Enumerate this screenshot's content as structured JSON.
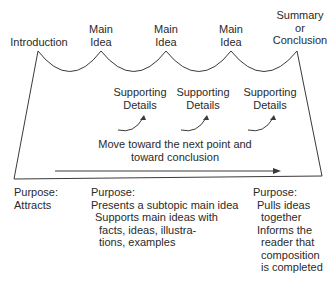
{
  "top_labels": {
    "introduction": "Introduction",
    "main_idea_1": [
      "Main",
      "Idea"
    ],
    "main_idea_2": [
      "Main",
      "Idea"
    ],
    "main_idea_3": [
      "Main",
      "Idea"
    ],
    "conclusion": [
      "Summary",
      "or",
      "Conclusion"
    ]
  },
  "supporting_details": [
    [
      "Supporting",
      "Details"
    ],
    [
      "Supporting",
      "Details"
    ],
    [
      "Supporting",
      "Details"
    ]
  ],
  "move_text": [
    "Move toward the next point and",
    "toward conclusion"
  ],
  "purposes": {
    "introduction": {
      "title": "Purpose:",
      "lines": [
        "Attracts"
      ]
    },
    "body": {
      "title": "Purpose:",
      "lines": [
        "Presents a subtopic main idea",
        "Supports main ideas with",
        "facts, ideas, illustra-",
        "tions, examples"
      ]
    },
    "conclusion": {
      "title": "Purpose:",
      "lines": [
        "Pulls ideas",
        "together",
        "Informs the",
        "reader that",
        "composition",
        "is completed"
      ]
    }
  },
  "colors": {
    "line": "#3a3a3a",
    "text": "#2a2a2a"
  }
}
